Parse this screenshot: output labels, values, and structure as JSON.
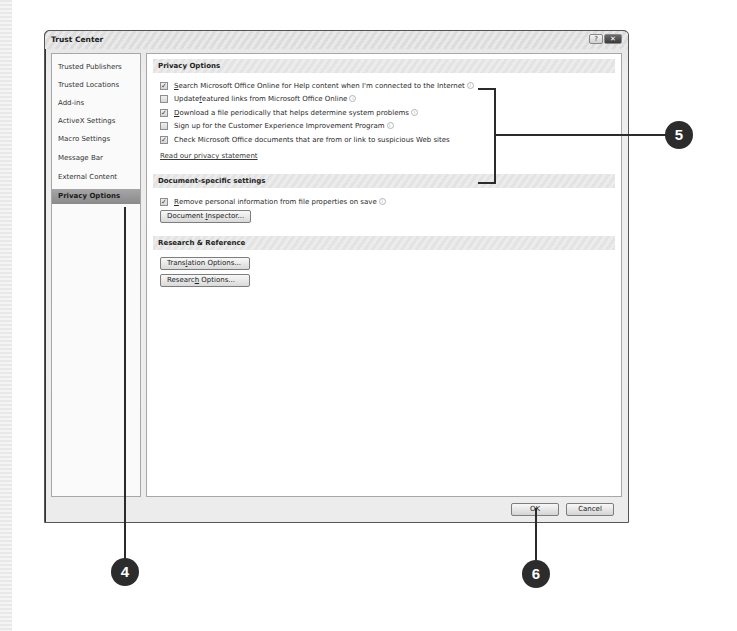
{
  "window": {
    "title": "Trust Center",
    "help_button": "?",
    "close_button": "✕"
  },
  "sidebar": {
    "items": [
      {
        "label": "Trusted Publishers",
        "active": false
      },
      {
        "label": "Trusted Locations",
        "active": false
      },
      {
        "label": "Add-ins",
        "active": false
      },
      {
        "label": "ActiveX Settings",
        "active": false
      },
      {
        "label": "Macro Settings",
        "active": false
      },
      {
        "label": "Message Bar",
        "active": false
      },
      {
        "label": "External Content",
        "active": false
      },
      {
        "label": "Privacy Options",
        "active": true
      }
    ]
  },
  "privacy": {
    "header": "Privacy Options",
    "options": [
      {
        "prefix": "",
        "accel": "S",
        "rest": "earch Microsoft Office Online for Help content when I'm connected to the Internet",
        "checked": true,
        "info": true
      },
      {
        "prefix": "Update ",
        "accel": "f",
        "rest": "eatured links from Microsoft Office Online",
        "checked": false,
        "info": true
      },
      {
        "prefix": "",
        "accel": "D",
        "rest": "ownload a file periodically that helps determine system problems",
        "checked": true,
        "info": true
      },
      {
        "prefix": "Si",
        "accel": "g",
        "rest": "n up for the Customer Experience Improvement Program",
        "checked": false,
        "info": true
      },
      {
        "prefix": "Check Microsoft Office documents that are from or link to suspicious Web sites",
        "accel": "",
        "rest": "",
        "checked": true,
        "info": false
      }
    ],
    "link": "Read our privacy statement"
  },
  "document": {
    "header": "Document-specific settings",
    "option": {
      "accel": "R",
      "rest": "emove personal information from file properties on save",
      "checked": true,
      "info": true
    },
    "inspector_button": {
      "prefix": "Document ",
      "accel": "I",
      "rest": "nspector..."
    }
  },
  "research": {
    "header": "Research & Reference",
    "translation_button": {
      "prefix": "Trans",
      "accel": "l",
      "rest": "ation Options..."
    },
    "research_button": {
      "prefix": "Researc",
      "accel": "h",
      "rest": " Options..."
    }
  },
  "footer": {
    "ok": "OK",
    "cancel": "Cancel"
  },
  "callouts": [
    {
      "number": "4",
      "target": "Privacy Options sidebar item"
    },
    {
      "number": "5",
      "target": "Privacy Options checkboxes"
    },
    {
      "number": "6",
      "target": "OK button"
    }
  ],
  "colors": {
    "callout_fill": "#2c2c2c",
    "selected_item": "#9a9a9a",
    "section_header": "#e6e6e6"
  }
}
